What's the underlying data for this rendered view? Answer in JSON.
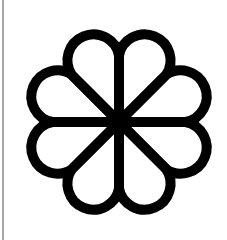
{
  "icon": {
    "semantic": "flower-icon",
    "petal_count": 8,
    "stroke_color": "#000000",
    "background_color": "#ffffff",
    "edge_line_color": "#a8a8a8"
  }
}
